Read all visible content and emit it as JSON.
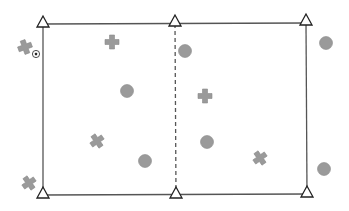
{
  "scene": {
    "type": "top-down training field",
    "background": "#ffffff",
    "line_color": "#555555",
    "piece_color": "#9a9a9a",
    "piece_stroke": "#8a8a8a"
  },
  "field": {
    "top_left": [
      43,
      24
    ],
    "top_right": [
      306,
      23
    ],
    "bottom_left": [
      43,
      195
    ],
    "bottom_right": [
      307,
      194
    ],
    "midline_x": 175,
    "midline_style": "dashed"
  },
  "cones": [
    {
      "id": "cone-top-left",
      "x": 43,
      "y": 22
    },
    {
      "id": "cone-top-middle",
      "x": 175,
      "y": 21
    },
    {
      "id": "cone-top-right",
      "x": 306,
      "y": 20
    },
    {
      "id": "cone-bottom-left",
      "x": 43,
      "y": 193
    },
    {
      "id": "cone-bottom-middle",
      "x": 176,
      "y": 193
    },
    {
      "id": "cone-bottom-right",
      "x": 307,
      "y": 192
    }
  ],
  "crosses": [
    {
      "id": "attacker-1",
      "x": 25,
      "y": 47,
      "rotation": -20
    },
    {
      "id": "attacker-2",
      "x": 112,
      "y": 42,
      "rotation": 0
    },
    {
      "id": "attacker-3",
      "x": 205,
      "y": 96,
      "rotation": 0
    },
    {
      "id": "attacker-4",
      "x": 97,
      "y": 141,
      "rotation": -35
    },
    {
      "id": "attacker-5",
      "x": 260,
      "y": 158,
      "rotation": -35
    },
    {
      "id": "attacker-6",
      "x": 29,
      "y": 183,
      "rotation": -35
    }
  ],
  "circles": [
    {
      "id": "defender-1",
      "x": 185,
      "y": 51
    },
    {
      "id": "defender-2",
      "x": 127,
      "y": 91
    },
    {
      "id": "defender-3",
      "x": 326,
      "y": 43
    },
    {
      "id": "defender-4",
      "x": 145,
      "y": 161
    },
    {
      "id": "defender-5",
      "x": 207,
      "y": 142
    },
    {
      "id": "defender-6",
      "x": 324,
      "y": 169
    }
  ],
  "ball": {
    "x": 36,
    "y": 54,
    "icon": "soccer-ball-icon"
  }
}
